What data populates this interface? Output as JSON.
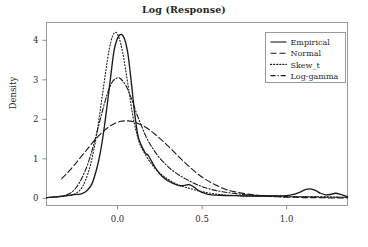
{
  "chart_data": {
    "type": "line",
    "title": "Log (Response)",
    "xlabel": "",
    "ylabel": "Density",
    "xlim": [
      -0.42,
      1.36
    ],
    "ylim": [
      -0.18,
      4.45
    ],
    "xticks": [
      0.0,
      0.5,
      1.0
    ],
    "xticklabels": [
      "0.0",
      "0.5",
      "1.0"
    ],
    "yticks": [
      0,
      1,
      2,
      3,
      4
    ],
    "yticklabels": [
      "0",
      "1",
      "2",
      "3",
      "4"
    ],
    "grid": false,
    "legend_position": "upper right",
    "series": [
      {
        "name": "Empirical",
        "style": "solid",
        "x": [
          -0.42,
          -0.39,
          -0.36,
          -0.33,
          -0.3,
          -0.27,
          -0.24,
          -0.21,
          -0.18,
          -0.15,
          -0.12,
          -0.1,
          -0.08,
          -0.06,
          -0.04,
          -0.02,
          0.0,
          0.02,
          0.04,
          0.06,
          0.08,
          0.1,
          0.12,
          0.14,
          0.16,
          0.17,
          0.18,
          0.2,
          0.22,
          0.25,
          0.28,
          0.31,
          0.34,
          0.37,
          0.4,
          0.42,
          0.44,
          0.46,
          0.48,
          0.5,
          0.53,
          0.56,
          0.6,
          0.65,
          0.7,
          0.75,
          0.8,
          0.85,
          0.9,
          0.95,
          1.0,
          1.04,
          1.08,
          1.11,
          1.14,
          1.17,
          1.2,
          1.23,
          1.26,
          1.29,
          1.32,
          1.36
        ],
        "y": [
          0.02,
          0.03,
          0.04,
          0.05,
          0.07,
          0.09,
          0.1,
          0.12,
          0.2,
          0.38,
          0.8,
          1.2,
          1.75,
          2.4,
          3.1,
          3.75,
          4.05,
          4.15,
          4.05,
          3.7,
          3.0,
          2.2,
          1.6,
          1.35,
          1.18,
          1.12,
          1.1,
          0.95,
          0.8,
          0.62,
          0.5,
          0.42,
          0.36,
          0.32,
          0.33,
          0.35,
          0.32,
          0.26,
          0.2,
          0.15,
          0.11,
          0.09,
          0.08,
          0.07,
          0.07,
          0.06,
          0.06,
          0.06,
          0.06,
          0.06,
          0.07,
          0.1,
          0.16,
          0.22,
          0.24,
          0.2,
          0.13,
          0.09,
          0.1,
          0.13,
          0.1,
          0.04
        ]
      },
      {
        "name": "Normal",
        "style": "dashed",
        "x": [
          -0.33,
          -0.3,
          -0.26,
          -0.22,
          -0.18,
          -0.14,
          -0.1,
          -0.06,
          -0.02,
          0.02,
          0.06,
          0.1,
          0.14,
          0.18,
          0.22,
          0.26,
          0.3,
          0.34,
          0.38,
          0.42,
          0.46,
          0.5,
          0.54,
          0.58,
          0.62,
          0.66,
          0.7,
          0.75,
          0.8,
          0.85,
          0.9,
          0.95,
          1.0,
          1.05,
          1.1,
          1.15,
          1.2,
          1.26,
          1.32,
          1.36
        ],
        "y": [
          0.5,
          0.63,
          0.82,
          1.03,
          1.24,
          1.45,
          1.63,
          1.78,
          1.89,
          1.95,
          1.96,
          1.93,
          1.86,
          1.76,
          1.63,
          1.48,
          1.32,
          1.15,
          0.98,
          0.82,
          0.67,
          0.54,
          0.43,
          0.34,
          0.26,
          0.2,
          0.16,
          0.12,
          0.09,
          0.07,
          0.05,
          0.04,
          0.03,
          0.03,
          0.02,
          0.02,
          0.02,
          0.01,
          0.01,
          0.01
        ]
      },
      {
        "name": "Skew_t",
        "style": "dotted",
        "x": [
          -0.42,
          -0.38,
          -0.34,
          -0.3,
          -0.26,
          -0.22,
          -0.19,
          -0.16,
          -0.13,
          -0.11,
          -0.09,
          -0.07,
          -0.05,
          -0.03,
          -0.01,
          0.01,
          0.03,
          0.05,
          0.07,
          0.09,
          0.11,
          0.13,
          0.15,
          0.18,
          0.21,
          0.24,
          0.27,
          0.3,
          0.34,
          0.38,
          0.42,
          0.46,
          0.5,
          0.55,
          0.6,
          0.66,
          0.72,
          0.78,
          0.85,
          0.92,
          1.0,
          1.08,
          1.16,
          1.24,
          1.32,
          1.36
        ],
        "y": [
          0.02,
          0.03,
          0.05,
          0.07,
          0.1,
          0.22,
          0.45,
          0.85,
          1.45,
          2.0,
          2.6,
          3.2,
          3.75,
          4.1,
          4.2,
          4.05,
          3.7,
          3.2,
          2.65,
          2.1,
          1.7,
          1.4,
          1.22,
          1.0,
          0.82,
          0.68,
          0.57,
          0.48,
          0.38,
          0.31,
          0.26,
          0.21,
          0.17,
          0.13,
          0.1,
          0.08,
          0.07,
          0.06,
          0.05,
          0.05,
          0.04,
          0.04,
          0.04,
          0.04,
          0.03,
          0.03
        ]
      },
      {
        "name": "Log-gamma",
        "style": "dashdot",
        "x": [
          -0.42,
          -0.38,
          -0.34,
          -0.3,
          -0.27,
          -0.24,
          -0.21,
          -0.18,
          -0.15,
          -0.12,
          -0.09,
          -0.06,
          -0.03,
          0.0,
          0.02,
          0.05,
          0.08,
          0.11,
          0.14,
          0.17,
          0.2,
          0.24,
          0.28,
          0.32,
          0.36,
          0.4,
          0.44,
          0.48,
          0.52,
          0.57,
          0.62,
          0.68,
          0.74,
          0.8,
          0.87,
          0.94,
          1.0,
          1.08,
          1.16,
          1.24,
          1.32,
          1.36
        ],
        "y": [
          0.02,
          0.03,
          0.05,
          0.09,
          0.16,
          0.3,
          0.52,
          0.82,
          1.22,
          1.7,
          2.2,
          2.65,
          2.95,
          3.05,
          3.02,
          2.85,
          2.55,
          2.18,
          1.85,
          1.55,
          1.32,
          1.07,
          0.88,
          0.72,
          0.6,
          0.5,
          0.41,
          0.33,
          0.27,
          0.21,
          0.17,
          0.13,
          0.1,
          0.08,
          0.07,
          0.06,
          0.05,
          0.04,
          0.04,
          0.03,
          0.03,
          0.03
        ]
      }
    ]
  },
  "legend": {
    "items": [
      {
        "label": "Empirical",
        "style": "solid"
      },
      {
        "label": "Normal",
        "style": "dashed"
      },
      {
        "label": "Skew_t",
        "style": "dotted"
      },
      {
        "label": "Log-gamma",
        "style": "dashdot"
      }
    ]
  },
  "colors": {
    "line": "#1a1a1a",
    "frame": "#9a9a9a",
    "text": "#2b2b2b",
    "background": "#ffffff"
  }
}
